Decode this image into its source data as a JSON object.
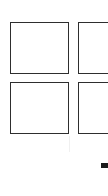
{
  "grid": {
    "columns": 2,
    "rows": 2,
    "tiles": [
      {
        "label": ""
      },
      {
        "label": ""
      },
      {
        "label": ""
      },
      {
        "label": ""
      }
    ]
  },
  "colors": {
    "background": "#ffffff",
    "tile_border": "#2e2e2e",
    "marker": "#1a1a1a"
  }
}
